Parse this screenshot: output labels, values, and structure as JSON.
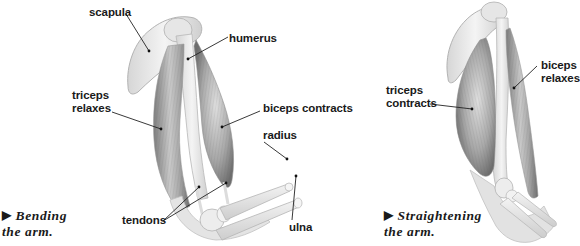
{
  "diagram": {
    "left_panel": {
      "caption_line1": "Bending",
      "caption_line2": "the arm.",
      "caption_marker": "▶",
      "labels": {
        "scapula": "scapula",
        "humerus": "humerus",
        "triceps_line1": "triceps",
        "triceps_line2": "relaxes",
        "biceps": "biceps contracts",
        "radius": "radius",
        "tendons": "tendons",
        "ulna": "ulna"
      }
    },
    "right_panel": {
      "caption_line1": "Straightening",
      "caption_line2": "the arm.",
      "caption_marker": "▶",
      "labels": {
        "triceps_line1": "triceps",
        "triceps_line2": "contracts",
        "biceps_line1": "biceps",
        "biceps_line2": "relaxes"
      }
    },
    "colors": {
      "label_text": "#1a1a1a",
      "leader_line": "#222222",
      "muscle_dark": "#8a8a8a",
      "muscle_light": "#d8d8d8",
      "bone": "#ececec",
      "bone_outline": "#b5b5b5"
    }
  }
}
